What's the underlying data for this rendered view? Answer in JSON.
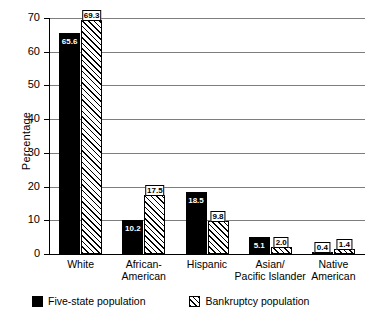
{
  "chart_data": {
    "type": "bar",
    "title": "",
    "xlabel": "",
    "ylabel": "Percentage",
    "ylim": [
      0,
      70
    ],
    "ytick_step": 10,
    "yticks": [
      "0",
      "10",
      "20",
      "30",
      "40",
      "50",
      "60",
      "70"
    ],
    "grid": "horizontal",
    "legend_position": "bottom-left",
    "categories": [
      "White",
      "African-\nAmerican",
      "Hispanic",
      "Asian/\nPacific Islander",
      "Native American"
    ],
    "category_lines": [
      [
        "White"
      ],
      [
        "African-",
        "American"
      ],
      [
        "Hispanic"
      ],
      [
        "Asian/",
        "Pacific Islander"
      ],
      [
        "Native American"
      ]
    ],
    "series": [
      {
        "name": "Five-state population",
        "style": "solid-black",
        "values": [
          65.6,
          10.2,
          18.5,
          5.1,
          0.4
        ],
        "labels": [
          "65.6",
          "10.2",
          "18.5",
          "5.1",
          "0.4"
        ]
      },
      {
        "name": "Bankruptcy population",
        "style": "diagonal-hatch",
        "values": [
          69.3,
          17.5,
          9.8,
          2.0,
          1.4
        ],
        "labels": [
          "69.3",
          "17.5",
          "9.8",
          "2.0",
          "1.4"
        ]
      }
    ]
  },
  "legend": {
    "items": [
      {
        "label": "Five-state population",
        "swatch": "solid-black"
      },
      {
        "label": "Bankruptcy population",
        "swatch": "diagonal-hatch"
      }
    ]
  },
  "colors": {
    "series_1": "#000000",
    "series_2_hatch": "#000000",
    "series_2_fill": "#ffffff",
    "gridline": "#7d7d7d",
    "axis": "#000000",
    "background": "#ffffff"
  }
}
